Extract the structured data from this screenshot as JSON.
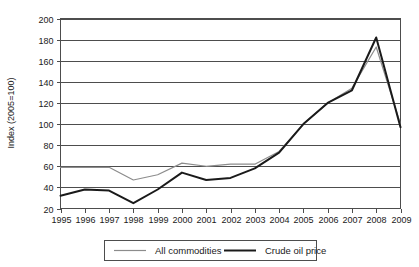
{
  "chart_data": {
    "type": "line",
    "title": "",
    "xlabel": "",
    "ylabel": "Index (2005=100)",
    "x": [
      1995,
      1996,
      1997,
      1998,
      1999,
      2000,
      2001,
      2002,
      2003,
      2004,
      2005,
      2006,
      2007,
      2008,
      2009
    ],
    "categories": [
      "1995",
      "1996",
      "1997",
      "1998",
      "1999",
      "2000",
      "2001",
      "2002",
      "2003",
      "2004",
      "2005",
      "2006",
      "2007",
      "2008",
      "2009"
    ],
    "xlim": [
      1995,
      2009
    ],
    "ylim": [
      20,
      200
    ],
    "ytick_step": 20,
    "yticks": [
      20,
      40,
      60,
      80,
      100,
      120,
      140,
      160,
      180,
      200
    ],
    "ytick_labels": [
      "20",
      "40",
      "60",
      "80",
      "100",
      "120",
      "140",
      "160",
      "180",
      "200"
    ],
    "grid": "horizontal",
    "legend_position": "bottom-center",
    "series": [
      {
        "name": "All commodities",
        "color": "#8c8c8c",
        "line_width": 1.2,
        "values": [
          59,
          59,
          59,
          47,
          52,
          63,
          60,
          62,
          62,
          74,
          100,
          120,
          134,
          173,
          100
        ]
      },
      {
        "name": "Crude oil price",
        "color": "#1a1a1a",
        "line_width": 2.0,
        "values": [
          32,
          38,
          37,
          25,
          38,
          54,
          47,
          49,
          58,
          73,
          100,
          120,
          132,
          182,
          97
        ]
      }
    ]
  },
  "legend": {
    "entries": [
      {
        "label": "All commodities"
      },
      {
        "label": "Crude oil price"
      }
    ]
  },
  "colors": {
    "all_commodities": "#8c8c8c",
    "crude_oil_price": "#1a1a1a",
    "axis": "#4d4d4d",
    "text": "#1a1a1a",
    "background": "#ffffff"
  }
}
